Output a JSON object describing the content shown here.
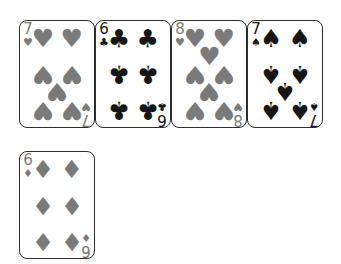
{
  "page": {
    "background_color": "#ffffff"
  },
  "style": {
    "card_background": "#ffffff",
    "card_border_color": "#2e2e2e",
    "red_suit_color": "#7a7a7a",
    "black_suit_color": "#161616"
  },
  "suits": {
    "hearts": {
      "symbol": "♥",
      "color": "red"
    },
    "diamonds": {
      "symbol": "♦",
      "color": "red"
    },
    "clubs": {
      "symbol": "♣",
      "color": "black"
    },
    "spades": {
      "symbol": "♠",
      "color": "black"
    }
  },
  "pip_layouts": {
    "6": [
      {
        "x": 31,
        "y": 16,
        "inverted": false
      },
      {
        "x": 70,
        "y": 16,
        "inverted": false
      },
      {
        "x": 31,
        "y": 50,
        "inverted": true
      },
      {
        "x": 70,
        "y": 50,
        "inverted": true
      },
      {
        "x": 31,
        "y": 84,
        "inverted": true
      },
      {
        "x": 70,
        "y": 84,
        "inverted": true
      }
    ],
    "7": [
      {
        "x": 31,
        "y": 16,
        "inverted": false
      },
      {
        "x": 70,
        "y": 16,
        "inverted": false
      },
      {
        "x": 31,
        "y": 50,
        "inverted": true
      },
      {
        "x": 70,
        "y": 50,
        "inverted": true
      },
      {
        "x": 50.5,
        "y": 66,
        "inverted": true
      },
      {
        "x": 31,
        "y": 84,
        "inverted": true
      },
      {
        "x": 70,
        "y": 84,
        "inverted": true
      }
    ],
    "8": [
      {
        "x": 31,
        "y": 16,
        "inverted": false
      },
      {
        "x": 70,
        "y": 16,
        "inverted": false
      },
      {
        "x": 50.5,
        "y": 33,
        "inverted": false
      },
      {
        "x": 31,
        "y": 50,
        "inverted": true
      },
      {
        "x": 70,
        "y": 50,
        "inverted": true
      },
      {
        "x": 50.5,
        "y": 66,
        "inverted": true
      },
      {
        "x": 31,
        "y": 84,
        "inverted": true
      },
      {
        "x": 70,
        "y": 84,
        "inverted": true
      }
    ]
  },
  "cards": [
    {
      "id": "7-hearts",
      "rank": "7",
      "suit": "hearts",
      "row": 0
    },
    {
      "id": "6-clubs",
      "rank": "6",
      "suit": "clubs",
      "row": 0
    },
    {
      "id": "8-hearts",
      "rank": "8",
      "suit": "hearts",
      "row": 0
    },
    {
      "id": "7-spades",
      "rank": "7",
      "suit": "spades",
      "row": 0
    },
    {
      "id": "6-diamonds",
      "rank": "6",
      "suit": "diamonds",
      "row": 1
    }
  ]
}
